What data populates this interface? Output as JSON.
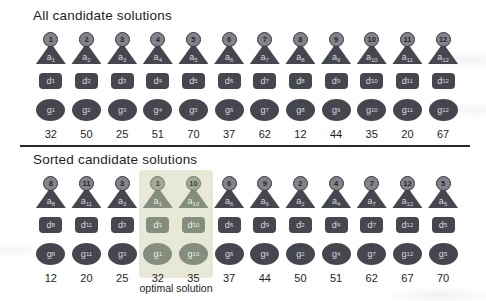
{
  "sections": [
    {
      "title": "All candidate solutions",
      "candidates": [
        {
          "id": "1",
          "value": "32",
          "highlight": false
        },
        {
          "id": "2",
          "value": "50",
          "highlight": false
        },
        {
          "id": "3",
          "value": "25",
          "highlight": false
        },
        {
          "id": "4",
          "value": "51",
          "highlight": false
        },
        {
          "id": "5",
          "value": "70",
          "highlight": false
        },
        {
          "id": "6",
          "value": "37",
          "highlight": false
        },
        {
          "id": "7",
          "value": "62",
          "highlight": false
        },
        {
          "id": "8",
          "value": "12",
          "highlight": false
        },
        {
          "id": "9",
          "value": "44",
          "highlight": false
        },
        {
          "id": "10",
          "value": "35",
          "highlight": false
        },
        {
          "id": "11",
          "value": "20",
          "highlight": false
        },
        {
          "id": "12",
          "value": "67",
          "highlight": false
        }
      ]
    },
    {
      "title": "Sorted candidate solutions",
      "annotation": "optimal solution",
      "candidates": [
        {
          "id": "8",
          "value": "12",
          "highlight": false
        },
        {
          "id": "11",
          "value": "20",
          "highlight": false
        },
        {
          "id": "3",
          "value": "25",
          "highlight": false
        },
        {
          "id": "1",
          "value": "32",
          "highlight": true
        },
        {
          "id": "10",
          "value": "35",
          "highlight": true
        },
        {
          "id": "6",
          "value": "37",
          "highlight": false
        },
        {
          "id": "9",
          "value": "44",
          "highlight": false
        },
        {
          "id": "2",
          "value": "50",
          "highlight": false
        },
        {
          "id": "4",
          "value": "51",
          "highlight": false
        },
        {
          "id": "7",
          "value": "62",
          "highlight": false
        },
        {
          "id": "12",
          "value": "67",
          "highlight": false
        },
        {
          "id": "5",
          "value": "70",
          "highlight": false
        }
      ]
    }
  ],
  "glyphs": {
    "agent_letter": "a",
    "decision_letter": "d",
    "decision_mark": "′",
    "genotype_letter": "g"
  },
  "colors": {
    "shape_dark": "#46464e",
    "head_fill": "#83838a",
    "shape_highlight": "#848d7e",
    "highlight_box": "#e7e8d6",
    "separator": "#2a2a2e",
    "text": "#1d1d1d"
  }
}
